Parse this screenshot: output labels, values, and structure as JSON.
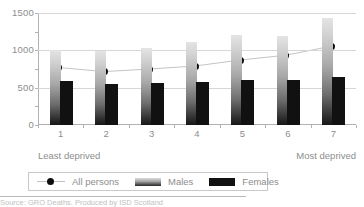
{
  "chart_data": {
    "type": "bar",
    "title": "",
    "xlabel": "",
    "ylabel": "",
    "ylim": [
      0,
      1500
    ],
    "grid": true,
    "legend_position": "bottom-left",
    "categories": [
      "1",
      "2",
      "3",
      "4",
      "5",
      "6",
      "7"
    ],
    "y_ticks": [
      0,
      500,
      1000,
      1500
    ],
    "y_tick_labels": [
      "0",
      "500",
      "1000",
      "1500"
    ],
    "axis_notes": {
      "left_end": "Least deprived",
      "right_end": "Most deprived"
    },
    "series": [
      {
        "name": "Males",
        "render": "bar",
        "color": "#a0a0a0",
        "values": [
          1000,
          995,
          1030,
          1115,
          1210,
          1195,
          1430
        ]
      },
      {
        "name": "Females",
        "render": "bar",
        "color": "#111111",
        "values": [
          585,
          545,
          565,
          580,
          605,
          600,
          640
        ]
      },
      {
        "name": "All persons",
        "render": "line-marker",
        "color": "#0d0d0d",
        "values": [
          770,
          715,
          750,
          790,
          870,
          935,
          1055
        ]
      }
    ]
  },
  "legend": {
    "items": [
      {
        "label": "All persons",
        "icon": "filled-circle-marker-icon"
      },
      {
        "label": "Males",
        "icon": "gradient-bar-swatch-icon"
      },
      {
        "label": "Females",
        "icon": "black-bar-swatch-icon"
      }
    ]
  },
  "footnote": {
    "source_text": "Source: GRO Deaths. Produced by ISD Scotland"
  }
}
